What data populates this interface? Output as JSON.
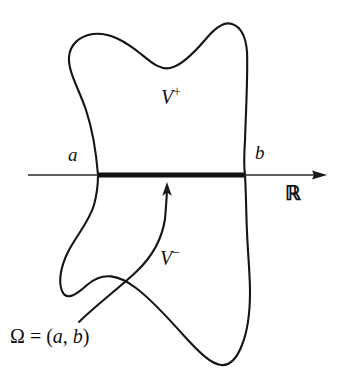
{
  "figure": {
    "type": "mathematical-diagram",
    "background_color": "#ffffff",
    "ink_color": "#151515"
  },
  "labels": {
    "point_a": "a",
    "point_b": "b",
    "region_upper": "V",
    "region_upper_sup": "+",
    "region_lower": "V",
    "region_lower_sup": "−",
    "axis": "ℝ",
    "omega_symbol": "Ω",
    "omega_equals": " = (",
    "omega_a": "a",
    "omega_comma": ", ",
    "omega_b": "b",
    "omega_close": ")",
    "omega_full": "Ω = (a, b)"
  },
  "geometry": {
    "axis_line": {
      "x1": 28,
      "y1": 175,
      "x2": 327,
      "y2": 175
    },
    "interval_segment": {
      "x1": 98,
      "y1": 175,
      "x2": 245,
      "y2": 175,
      "thickness": 5
    },
    "arrow_head_tip_x": 327,
    "pointer_arrow_tip": {
      "x": 167,
      "y": 183
    },
    "pointer_arrow_start": {
      "x": 79,
      "y": 322
    },
    "blob_crossing_left_x": 98,
    "blob_crossing_right_x": 245
  }
}
